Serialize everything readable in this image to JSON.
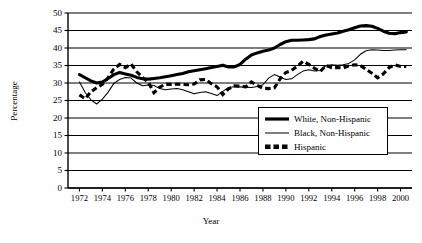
{
  "chart_data": {
    "type": "line",
    "title": "",
    "xlabel": "Year",
    "ylabel": "Percentage",
    "xlim": [
      1971,
      2001
    ],
    "ylim": [
      0,
      50
    ],
    "ytick_step": 5,
    "xtick_step": 2,
    "grid": "horizontal",
    "legend_position": "center-right-inside",
    "ytick_labels": [
      "0",
      "5",
      "10",
      "15",
      "20",
      "25",
      "30",
      "35",
      "40",
      "45",
      "50"
    ],
    "xtick_labels": [
      "1972",
      "1974",
      "1976",
      "1978",
      "1980",
      "1982",
      "1984",
      "1986",
      "1988",
      "1990",
      "1992",
      "1994",
      "1996",
      "1998",
      "2000"
    ],
    "x": [
      1972,
      1972.5,
      1973,
      1973.5,
      1974,
      1974.5,
      1975,
      1975.5,
      1976,
      1976.5,
      1977,
      1977.5,
      1978,
      1978.5,
      1979,
      1979.5,
      1980,
      1980.5,
      1981,
      1981.5,
      1982,
      1982.5,
      1983,
      1983.5,
      1984,
      1984.5,
      1985,
      1985.5,
      1986,
      1986.5,
      1987,
      1987.5,
      1988,
      1988.5,
      1989,
      1989.5,
      1990,
      1990.5,
      1991,
      1991.5,
      1992,
      1992.5,
      1993,
      1993.5,
      1994,
      1994.5,
      1995,
      1995.5,
      1996,
      1996.5,
      1997,
      1997.5,
      1998,
      1998.5,
      1999,
      1999.5,
      2000,
      2000.5
    ],
    "series": [
      {
        "name": "White, Non-Hispanic",
        "style": "thick-solid",
        "color": "#000000",
        "values": [
          32.4,
          31.5,
          30.6,
          30.0,
          30.3,
          31.3,
          32.4,
          33.0,
          32.6,
          32.2,
          31.6,
          31.2,
          31.1,
          31.3,
          31.5,
          31.8,
          32.1,
          32.4,
          32.7,
          33.2,
          33.5,
          33.8,
          34.1,
          34.4,
          34.7,
          35.1,
          34.6,
          34.6,
          35.3,
          36.8,
          38.0,
          38.6,
          39.1,
          39.4,
          40.0,
          41.0,
          41.8,
          42.2,
          42.2,
          42.3,
          42.4,
          42.6,
          43.3,
          43.7,
          44.0,
          44.3,
          44.8,
          45.2,
          45.8,
          46.3,
          46.4,
          46.2,
          45.6,
          44.8,
          44.2,
          44.1,
          44.4,
          44.6
        ]
      },
      {
        "name": "Black, Non-Hispanic",
        "style": "thin-solid",
        "color": "#000000",
        "values": [
          30.3,
          27.3,
          25.2,
          24.0,
          25.4,
          27.4,
          29.9,
          31.0,
          31.6,
          31.4,
          30.0,
          29.2,
          29.4,
          29.3,
          28.4,
          28.1,
          28.3,
          28.4,
          28.1,
          27.5,
          26.9,
          27.3,
          27.5,
          27.0,
          26.4,
          27.6,
          28.7,
          28.9,
          28.9,
          28.8,
          28.7,
          29.0,
          29.5,
          31.4,
          32.4,
          31.7,
          31.0,
          31.2,
          32.4,
          33.4,
          33.8,
          33.4,
          33.6,
          35.0,
          35.2,
          35.1,
          35.2,
          35.6,
          36.6,
          38.2,
          39.2,
          39.5,
          39.4,
          39.3,
          39.3,
          39.4,
          39.5,
          39.5
        ]
      },
      {
        "name": "Hispanic",
        "style": "dashed-square",
        "color": "#000000",
        "values": [
          26.6,
          25.5,
          27.5,
          28.7,
          29.6,
          31.5,
          34.0,
          35.3,
          34.4,
          35.4,
          33.2,
          31.6,
          30.2,
          27.2,
          28.8,
          29.7,
          29.6,
          29.7,
          29.6,
          29.5,
          29.7,
          30.9,
          31.0,
          29.8,
          28.9,
          26.7,
          28.3,
          29.2,
          29.1,
          28.9,
          30.3,
          29.3,
          28.5,
          28.4,
          28.6,
          31.2,
          33.0,
          33.6,
          34.8,
          36.2,
          35.3,
          34.2,
          33.3,
          35.0,
          34.4,
          34.4,
          34.3,
          34.9,
          35.2,
          35.0,
          33.9,
          32.8,
          31.5,
          32.6,
          34.4,
          35.2,
          34.7,
          34.7
        ]
      }
    ]
  },
  "legend": {
    "items": [
      {
        "label": "White, Non-Hispanic"
      },
      {
        "label": "Black, Non-Hispanic"
      },
      {
        "label": "Hispanic"
      }
    ]
  }
}
